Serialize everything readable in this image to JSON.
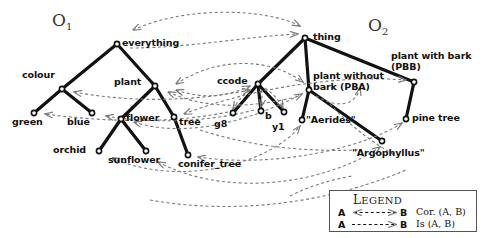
{
  "figure": {
    "type": "ontology-alignment-diagram",
    "width": 486,
    "height": 238,
    "background_color": "#ffffff",
    "edge_color": "#111111",
    "mapping_color": "#7a7a7a"
  },
  "ontologies": [
    {
      "id": "O1",
      "label": "O",
      "subscript": "1",
      "x": 52,
      "y": 12
    },
    {
      "id": "O2",
      "label": "O",
      "subscript": "2",
      "x": 368,
      "y": 17
    }
  ],
  "nodes": [
    {
      "id": "everything",
      "label": "everything",
      "x": 117,
      "y": 44,
      "label_x": 122,
      "label_y": 39,
      "anchor": "left",
      "lines": 1
    },
    {
      "id": "colour",
      "label": "colour",
      "x": 62,
      "y": 89,
      "label_x": 22,
      "label_y": 71,
      "anchor": "left",
      "lines": 1
    },
    {
      "id": "plant",
      "label": "plant",
      "x": 155,
      "y": 86,
      "label_x": 116,
      "label_y": 78,
      "anchor": "left",
      "lines": 1
    },
    {
      "id": "green",
      "label": "green",
      "x": 34,
      "y": 113,
      "label_x": 14,
      "label_y": 119,
      "anchor": "left",
      "lines": 1
    },
    {
      "id": "blue",
      "label": "blue",
      "x": 92,
      "y": 113,
      "label_x": 69,
      "label_y": 119,
      "anchor": "left",
      "lines": 1
    },
    {
      "id": "flower",
      "label": "flower",
      "x": 121,
      "y": 119,
      "label_x": 126,
      "label_y": 114,
      "anchor": "left",
      "lines": 1
    },
    {
      "id": "tree",
      "label": "tree",
      "x": 174,
      "y": 117,
      "label_x": 179,
      "label_y": 118,
      "anchor": "left",
      "lines": 1
    },
    {
      "id": "orchid",
      "label": "orchid",
      "x": 99,
      "y": 151,
      "label_x": 56,
      "label_y": 147,
      "anchor": "left",
      "lines": 1
    },
    {
      "id": "sunflower",
      "label": "sunflower",
      "x": 146,
      "y": 151,
      "label_x": 110,
      "label_y": 157,
      "anchor": "left",
      "lines": 1
    },
    {
      "id": "conifer_tree",
      "label": "conifer_tree",
      "x": 188,
      "y": 155,
      "label_x": 179,
      "label_y": 161,
      "anchor": "left",
      "lines": 1
    },
    {
      "id": "thing",
      "label": "thing",
      "x": 305,
      "y": 38,
      "label_x": 313,
      "label_y": 33,
      "anchor": "left",
      "lines": 1
    },
    {
      "id": "ccode",
      "label": "ccode",
      "x": 258,
      "y": 84,
      "label_x": 219,
      "label_y": 77,
      "anchor": "left",
      "lines": 1
    },
    {
      "id": "pba",
      "label": "plant without bark (PBA)",
      "x": 309,
      "y": 90,
      "label_x": 314,
      "label_y": 72,
      "anchor": "left",
      "lines": 2
    },
    {
      "id": "pbb",
      "label": "plant with bark (PBB)",
      "x": 414,
      "y": 82,
      "label_x": 392,
      "label_y": 52,
      "anchor": "left",
      "lines": 2
    },
    {
      "id": "g8",
      "label": "g8",
      "x": 233,
      "y": 113,
      "label_x": 215,
      "label_y": 120,
      "anchor": "left",
      "lines": 1
    },
    {
      "id": "b",
      "label": "b",
      "x": 261,
      "y": 111,
      "label_x": 266,
      "label_y": 113,
      "anchor": "left",
      "lines": 1
    },
    {
      "id": "y1",
      "label": "y1",
      "x": 284,
      "y": 112,
      "label_x": 273,
      "label_y": 123,
      "anchor": "left",
      "lines": 1
    },
    {
      "id": "aerides",
      "label": "\"Aerides\"",
      "x": 302,
      "y": 120,
      "label_x": 306,
      "label_y": 116,
      "anchor": "left",
      "lines": 1
    },
    {
      "id": "argophyllus",
      "label": "\"Argophyllus\"",
      "x": 382,
      "y": 141,
      "label_x": 355,
      "label_y": 148,
      "anchor": "left",
      "lines": 1
    },
    {
      "id": "pine_tree",
      "label": "pine tree",
      "x": 406,
      "y": 119,
      "label_x": 412,
      "label_y": 114,
      "anchor": "left",
      "lines": 1
    }
  ],
  "taxonomy_edges": [
    {
      "from": "everything",
      "to": "colour"
    },
    {
      "from": "everything",
      "to": "plant"
    },
    {
      "from": "colour",
      "to": "green"
    },
    {
      "from": "colour",
      "to": "blue"
    },
    {
      "from": "plant",
      "to": "flower"
    },
    {
      "from": "plant",
      "to": "tree"
    },
    {
      "from": "flower",
      "to": "orchid"
    },
    {
      "from": "flower",
      "to": "sunflower"
    },
    {
      "from": "tree",
      "to": "conifer_tree"
    },
    {
      "from": "thing",
      "to": "ccode"
    },
    {
      "from": "thing",
      "to": "pba"
    },
    {
      "from": "thing",
      "to": "pbb"
    },
    {
      "from": "ccode",
      "to": "g8"
    },
    {
      "from": "ccode",
      "to": "b"
    },
    {
      "from": "ccode",
      "to": "y1"
    },
    {
      "from": "pba",
      "to": "aerides"
    },
    {
      "from": "pba",
      "to": "argophyllus"
    },
    {
      "from": "pbb",
      "to": "pine_tree"
    }
  ],
  "mappings": [
    {
      "kind": "cor",
      "from": "everything",
      "to": "thing",
      "label": "Cor. (everything, thing)"
    },
    {
      "kind": "cor",
      "from": "plant",
      "to": "pba",
      "label": "Cor. (plant, plant without bark (PBA))"
    },
    {
      "kind": "cor",
      "from": "plant",
      "to": "ccode",
      "label": "Cor. (plant, ccode)"
    },
    {
      "kind": "cor",
      "from": "colour",
      "to": "ccode",
      "label": "Cor. (colour, ccode)"
    },
    {
      "kind": "is",
      "from": "ccode",
      "to": "g8",
      "label": "Is (ccode, g8)"
    },
    {
      "kind": "is",
      "from": "ccode",
      "to": "b",
      "label": "Is (ccode, b)"
    },
    {
      "kind": "cor",
      "from": "green",
      "to": "g8",
      "label": "Cor. (green, g8)"
    },
    {
      "kind": "cor",
      "from": "blue",
      "to": "b",
      "label": "Cor. (blue, b)"
    },
    {
      "kind": "cor",
      "from": "flower",
      "to": "pba",
      "label": "Cor. (flower, plant without bark (PBA))"
    },
    {
      "kind": "cor",
      "from": "tree",
      "to": "pbb",
      "label": "Cor. (tree, plant with bark (PBB))"
    },
    {
      "kind": "cor",
      "from": "conifer_tree",
      "to": "pine_tree",
      "label": "Cor. (conifer_tree, pine tree)"
    },
    {
      "kind": "cor",
      "from": "orchid",
      "to": "aerides",
      "label": "Cor. (orchid, \"Aerides\")"
    },
    {
      "kind": "cor",
      "from": "sunflower",
      "to": "argophyllus",
      "label": "Cor. (sunflower, \"Argophyllus\")"
    },
    {
      "kind": "is",
      "from": "pba",
      "to": "pbb",
      "label": "Is (plant without bark (PBA), plant with bark (PBB))"
    }
  ],
  "legend": {
    "title": "LEGEND",
    "title_cap": "L",
    "title_rest": "EGEND",
    "rows": [
      {
        "id": "cor",
        "endpoint_a": "A",
        "endpoint_b": "B",
        "description": "Cor. (A, B)",
        "arrow": "double"
      },
      {
        "id": "is",
        "endpoint_a": "A",
        "endpoint_b": "B",
        "description": "Is (A, B)",
        "arrow": "single"
      }
    ]
  }
}
